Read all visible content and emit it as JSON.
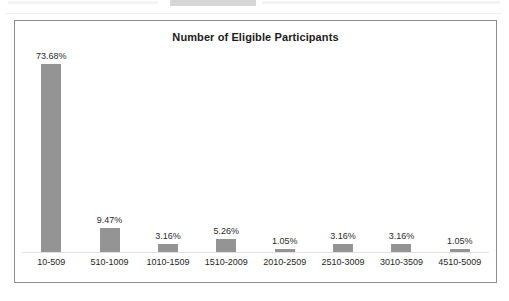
{
  "chart_data": {
    "type": "bar",
    "title": "Number of Eligible Participants",
    "xlabel": "",
    "ylabel": "",
    "ylim": [
      0,
      80
    ],
    "grid": false,
    "legend": false,
    "categories": [
      "10-509",
      "510-1009",
      "1010-1509",
      "1510-2009",
      "2010-2509",
      "2510-3009",
      "3010-3509",
      "4510-5009"
    ],
    "values": [
      73.68,
      9.47,
      3.16,
      5.26,
      1.05,
      3.16,
      3.16,
      1.05
    ],
    "value_labels": [
      "73.68%",
      "9.47%",
      "3.16%",
      "5.26%",
      "1.05%",
      "3.16%",
      "3.16%",
      "1.05%"
    ],
    "bar_color": "#949494",
    "frame_color": "#8d8d8d",
    "baseline_color": "#e2e2e2",
    "background": "#ffffff"
  }
}
